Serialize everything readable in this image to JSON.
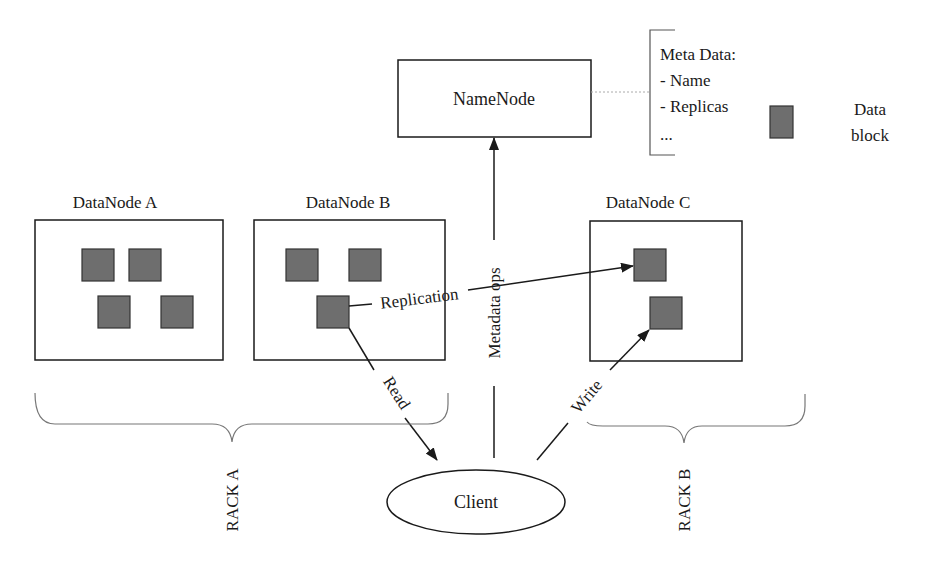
{
  "diagram": {
    "type": "HDFS architecture",
    "namenode": {
      "label": "NameNode"
    },
    "metadata": {
      "title": "Meta Data:",
      "items": [
        "- Name",
        "- Replicas",
        "..."
      ]
    },
    "legend": {
      "label_line1": "Data",
      "label_line2": "block",
      "color": "#6e6e6e"
    },
    "datanodes": [
      {
        "label": "DataNode A",
        "blocks": 4
      },
      {
        "label": "DataNode B",
        "blocks": 3
      },
      {
        "label": "DataNode C",
        "blocks": 2
      }
    ],
    "client": {
      "label": "Client"
    },
    "edges": {
      "replication": "Replication",
      "metadata_ops": "Metadata ops",
      "read": "Read",
      "write": "Write"
    },
    "racks": [
      {
        "label": "RACK A"
      },
      {
        "label": "RACK B"
      }
    ],
    "colors": {
      "line": "#1a1a1a",
      "block_fill": "#6e6e6e",
      "dotted": "#aaaaaa"
    }
  }
}
